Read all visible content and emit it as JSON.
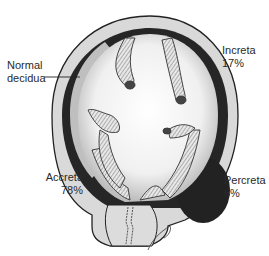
{
  "diagram": {
    "labels": {
      "normal_decidua": {
        "line1": "Normal",
        "line2": "decidua"
      },
      "increta": {
        "name": "Increta",
        "percent": "17%"
      },
      "accreta": {
        "name": "Accreta",
        "percent": "78%"
      },
      "percreta": {
        "name": "Percreta",
        "percent": "5%"
      }
    },
    "colors": {
      "background": "#ffffff",
      "uterine_wall": "#d9d9d9",
      "outline": "#222222",
      "dark_invasion": "#262626",
      "cavity": "#f2f2f2",
      "text": "#2a2a2a"
    }
  }
}
